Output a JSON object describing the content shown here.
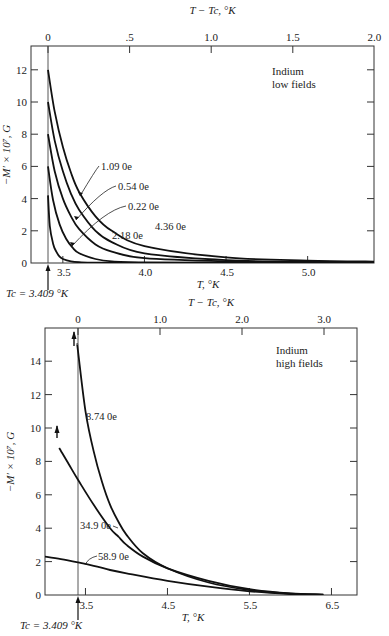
{
  "chart_data": [
    {
      "type": "line",
      "title": "Indium low fields",
      "annotation": [
        "Indium",
        "low fields"
      ],
      "xlabel": "T, °K",
      "x2label": "T − Tc, °K",
      "ylabel": "−M′ × 10⁷, G",
      "xlim": [
        3.409,
        5.45
      ],
      "ylim": [
        0,
        13
      ],
      "x_ticks": [
        "3.5",
        "4.0",
        "4.5",
        "5.0"
      ],
      "x_tick_values": [
        3.5,
        4.0,
        4.5,
        5.0
      ],
      "x2_ticks": [
        "0",
        ".5",
        "1.0",
        "1.5",
        "2.0"
      ],
      "x2_tick_values": [
        0,
        0.5,
        1.0,
        1.5,
        2.0
      ],
      "y_ticks": [
        "0",
        "2",
        "4",
        "6",
        "8",
        "10",
        "12"
      ],
      "y_tick_values": [
        0,
        2,
        4,
        6,
        8,
        10,
        12
      ],
      "tc_label": "Tc = 3.409 °K",
      "grid": false,
      "series": [
        {
          "name": "0.22 Oe",
          "x": [
            3.409,
            3.45,
            3.5,
            3.55,
            3.6,
            3.7,
            3.8,
            4.0,
            4.5,
            5.0,
            5.45
          ],
          "y": [
            12.0,
            9.4,
            7.2,
            5.6,
            4.4,
            2.9,
            2.0,
            1.05,
            0.35,
            0.15,
            0.08
          ]
        },
        {
          "name": "0.54 Oe",
          "x": [
            3.409,
            3.45,
            3.5,
            3.55,
            3.6,
            3.7,
            3.8,
            4.0,
            4.5,
            5.0,
            5.45
          ],
          "y": [
            10.0,
            7.6,
            5.7,
            4.3,
            3.3,
            2.0,
            1.3,
            0.6,
            0.18,
            0.08,
            0.05
          ]
        },
        {
          "name": "1.09 Oe",
          "x": [
            3.409,
            3.45,
            3.5,
            3.55,
            3.6,
            3.7,
            3.8,
            4.0,
            4.5,
            5.0,
            5.45
          ],
          "y": [
            8.0,
            5.7,
            4.0,
            2.9,
            2.1,
            1.15,
            0.7,
            0.3,
            0.1,
            0.05,
            0.03
          ]
        },
        {
          "name": "2.18 Oe",
          "x": [
            3.409,
            3.44,
            3.48,
            3.52,
            3.56,
            3.6,
            3.7,
            3.8,
            4.0,
            4.5,
            5.45
          ],
          "y": [
            6.0,
            3.9,
            2.4,
            1.5,
            0.95,
            0.6,
            0.25,
            0.1,
            0.04,
            0.02,
            0.01
          ]
        },
        {
          "name": "4.36 Oe",
          "x": [
            3.409,
            3.42,
            3.44,
            3.46,
            3.48,
            3.5,
            3.55,
            3.6,
            3.7,
            4.0,
            5.45
          ],
          "y": [
            4.2,
            2.3,
            1.2,
            0.7,
            0.4,
            0.25,
            0.1,
            0.05,
            0.02,
            0.01,
            0.0
          ]
        }
      ],
      "curve_labels": [
        {
          "text": "1.09 0e",
          "x": 101,
          "y": 170
        },
        {
          "text": "0.54 0e",
          "x": 118,
          "y": 190
        },
        {
          "text": "0.22 0e",
          "x": 128,
          "y": 210
        },
        {
          "text": "2.18 0e",
          "x": 112,
          "y": 239
        },
        {
          "text": "4.36 0e",
          "x": 155,
          "y": 230
        }
      ]
    },
    {
      "type": "line",
      "title": "Indium high fields",
      "annotation": [
        "Indium",
        "high fields"
      ],
      "xlabel": "T, °K",
      "x2label": "T − Tc, °K",
      "ylabel": "−M′ × 10⁷, G",
      "xlim": [
        3.0,
        6.75
      ],
      "ylim": [
        0,
        16
      ],
      "x_ticks": [
        "3.5",
        "4.5",
        "5.5",
        "6.5"
      ],
      "x_tick_values": [
        3.5,
        4.5,
        5.5,
        6.5
      ],
      "x2_ticks": [
        "0",
        "1.0",
        "2.0",
        "3.0"
      ],
      "x2_tick_values": [
        0,
        1.0,
        2.0,
        3.0
      ],
      "y_ticks": [
        "0",
        "2",
        "4",
        "6",
        "8",
        "10",
        "12",
        "14"
      ],
      "y_tick_values": [
        0,
        2,
        4,
        6,
        8,
        10,
        12,
        14
      ],
      "tc_label": "Tc = 3.409 °K",
      "grid": false,
      "series": [
        {
          "name": "8.74 Oe",
          "x": [
            3.4,
            3.409,
            3.5,
            3.6,
            3.7,
            3.8,
            3.9,
            4.0,
            4.2,
            4.5,
            5.0,
            5.5,
            6.0,
            6.4
          ],
          "y": [
            15.0,
            14.6,
            11.0,
            8.6,
            6.8,
            5.4,
            4.4,
            3.6,
            2.5,
            1.6,
            0.75,
            0.3,
            0.08,
            0.02
          ]
        },
        {
          "name": "34.9 Oe",
          "x": [
            3.18,
            3.3,
            3.409,
            3.6,
            3.8,
            3.9,
            4.0,
            4.2,
            4.5,
            5.0,
            5.5,
            6.0,
            6.4
          ],
          "y": [
            8.8,
            7.8,
            6.9,
            5.4,
            4.0,
            3.5,
            3.0,
            2.3,
            1.6,
            0.85,
            0.35,
            0.1,
            0.02
          ]
        },
        {
          "name": "58.9 Oe",
          "x": [
            3.0,
            3.2,
            3.409,
            3.6,
            3.8,
            4.0,
            4.5,
            5.0,
            5.5,
            6.0,
            6.4
          ],
          "y": [
            2.3,
            2.15,
            1.95,
            1.75,
            1.5,
            1.3,
            0.85,
            0.5,
            0.22,
            0.06,
            0.01
          ]
        }
      ],
      "curve_labels": [
        {
          "text": "8.74 0e",
          "x": 86,
          "y": 420
        },
        {
          "text": "34.9 0e",
          "x": 80,
          "y": 529
        },
        {
          "text": "58.9 0e",
          "x": 98,
          "y": 560
        }
      ]
    }
  ]
}
